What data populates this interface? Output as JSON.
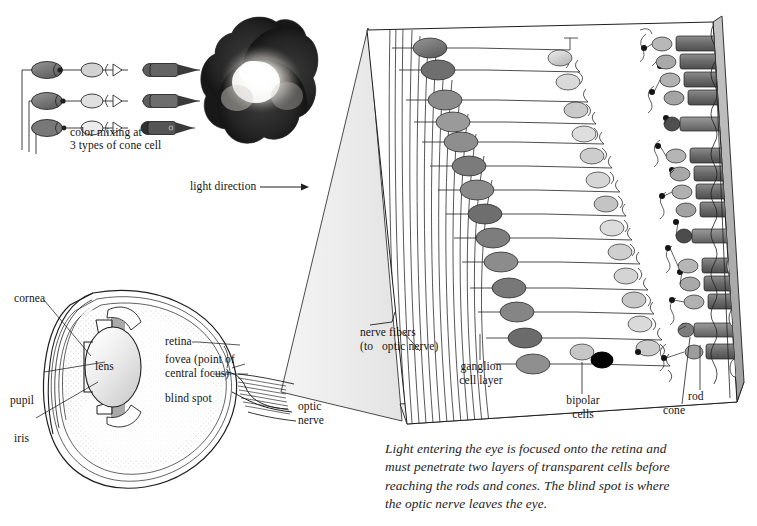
{
  "figure": {
    "domain": "diagram",
    "background_color": "#ffffff",
    "ink_color": "#141414"
  },
  "cone_mixing_panel": {
    "caption_line1": "color mixing at",
    "caption_line2": "3 types of cone cell",
    "rows": 3,
    "row_parts": [
      "ganglion-cell",
      "synapse-dot",
      "bipolar-cell",
      "synapse-triangle",
      "cone-cell"
    ],
    "ganglion_fills": [
      "#6e6e6e",
      "#6a6a6a",
      "#757575"
    ],
    "bipolar_fills": [
      "#c9c9c9",
      "#d8d8d8",
      "#e2e2e2"
    ],
    "cone_fills": [
      "#5e5e5e",
      "#6b6b6b",
      "#4a4a4a"
    ]
  },
  "color_photo": {
    "name": "additive-color-mixing-photograph",
    "description": "three overlapping light discs with bright white overlap at centre",
    "disc_count": 3,
    "center_highlight": "#f2efe8",
    "disc_dark": "#1e1e1e"
  },
  "light_direction": {
    "label": "light direction",
    "arrow": "→"
  },
  "eye_diagram": {
    "name": "eye-cross-section",
    "labels": {
      "cornea": "cornea",
      "pupil": "pupil",
      "iris": "iris",
      "lens": "lens",
      "retina": "retina",
      "fovea_line1": "fovea (point of",
      "fovea_line2": "central focus)",
      "blind_spot": "blind spot",
      "optic_nerve_line1": "optic",
      "optic_nerve_line2": "nerve"
    }
  },
  "retina_panel": {
    "name": "retina-magnified-slab",
    "labels": {
      "nerve_fibers_line1": "nerve fibers",
      "nerve_fibers_line2": "(to   optic nerve)",
      "ganglion_line1": "ganglion",
      "ganglion_line2": "cell layer",
      "bipolar_line1": "bipolar",
      "bipolar_line2": "cells",
      "cone": "cone",
      "rod": "rod"
    },
    "cell_columns": [
      "nerve fibers",
      "ganglion cell layer",
      "bipolar cells",
      "rods and cones",
      "pigment epithelium"
    ],
    "ganglion_count": 14,
    "bipolar_count": 14,
    "receptor_clusters": 5,
    "blind_spot_marker": "#000000"
  },
  "caption": {
    "text": "Light entering the eye is focused onto the retina and\nmust penetrate two layers of transparent cells before\nreaching the rods and cones. The blind spot is where\nthe optic nerve leaves the eye."
  }
}
